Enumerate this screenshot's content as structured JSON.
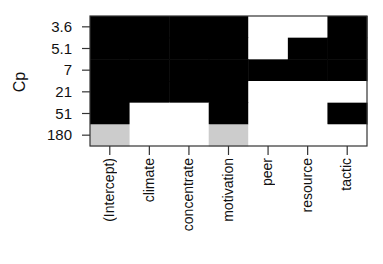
{
  "chart_data": {
    "type": "heatmap",
    "title": "",
    "xlabel": "",
    "ylabel": "Cp",
    "y_categories": [
      "3.6",
      "5.1",
      "7",
      "21",
      "51",
      "180"
    ],
    "x_categories": [
      "(Intercept)",
      "climate",
      "concentrate",
      "motivation",
      "peer",
      "resource",
      "tactic"
    ],
    "legend": null,
    "grid": false,
    "colors": {
      "included": "#000000",
      "excluded": "#ffffff",
      "partial": "#cccccc"
    },
    "cells": [
      {
        "row": "3.6",
        "values": [
          "black",
          "black",
          "black",
          "black",
          "white",
          "white",
          "black"
        ]
      },
      {
        "row": "5.1",
        "values": [
          "black",
          "black",
          "black",
          "black",
          "white",
          "black",
          "black"
        ]
      },
      {
        "row": "7",
        "values": [
          "black",
          "black",
          "black",
          "black",
          "black",
          "black",
          "black"
        ]
      },
      {
        "row": "21",
        "values": [
          "black",
          "black",
          "black",
          "black",
          "white",
          "white",
          "white"
        ]
      },
      {
        "row": "51",
        "values": [
          "black",
          "white",
          "white",
          "black",
          "white",
          "white",
          "black"
        ]
      },
      {
        "row": "180",
        "values": [
          "gray",
          "white",
          "white",
          "gray",
          "white",
          "white",
          "white"
        ]
      }
    ]
  },
  "axis": {
    "ylabel": "Cp",
    "yticks": [
      "3.6",
      "5.1",
      "7",
      "21",
      "51",
      "180"
    ],
    "xticks": [
      "(Intercept)",
      "climate",
      "concentrate",
      "motivation",
      "peer",
      "resource",
      "tactic"
    ]
  }
}
